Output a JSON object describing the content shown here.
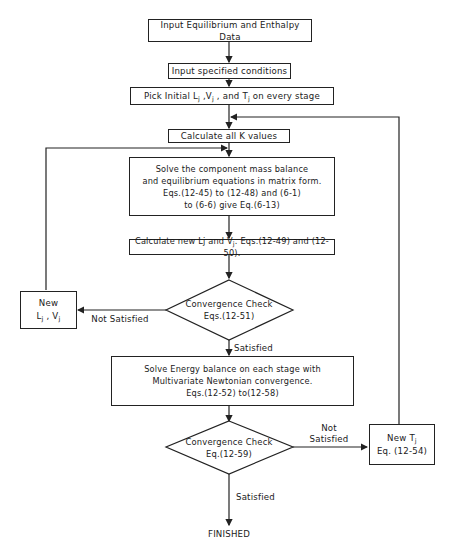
{
  "flowchart": {
    "steps": {
      "input_data": "Input Equilibrium and Enthalpy Data",
      "input_conditions": "Input  specified conditions",
      "pick_initial": {
        "prefix": "Pick Initial  L",
        "sub1": "j",
        "mid1": " ,V",
        "sub2": "j",
        "mid2": " , and  T",
        "sub3": "j",
        "suffix": "  on  every  stage"
      },
      "calc_k": "Calculate all K values",
      "solve_mass_balance": "Solve the component mass balance\nand  equilibrium  equations in matrix  form.\nEqs.(12-45) to (12-48) and (6-1)\nto (6-6) give Eq.(6-13)",
      "calc_new_lv": {
        "prefix": "Calculate new Lj and V",
        "sub": "j",
        "suffix": ".  Eqs.(12-49) and (12-50)."
      },
      "convergence_check_1": "Convergence Check\nEqs.(12-51)",
      "new_lv": {
        "line1": "New",
        "l": "L",
        "l_sub": "j",
        "sep": " , V",
        "v_sub": "j"
      },
      "solve_energy_balance": "Solve Energy balance on each stage with\nMultivariate Newtonian convergence.\nEqs.(12-52) to(12-58)",
      "convergence_check_2": "Convergence Check\nEq.(12-59)",
      "new_t": {
        "line1_prefix": "New T",
        "line1_sub": "j",
        "line2": "Eq. (12-54)"
      },
      "finished": "FINISHED"
    },
    "edge_labels": {
      "not_satisfied_1": "Not Satisfied",
      "satisfied_1": "Satisfied",
      "not_satisfied_2": "Not\nSatisfied",
      "satisfied_2": "Satisfied"
    },
    "colors": {
      "line": "#222222",
      "background": "#ffffff"
    }
  }
}
